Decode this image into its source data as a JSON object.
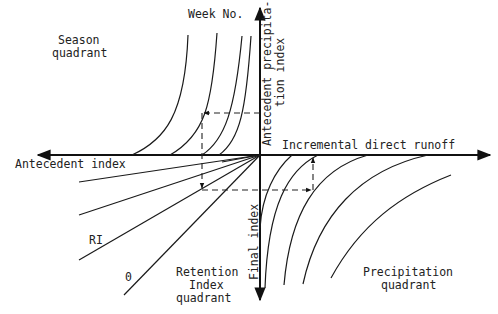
{
  "labels": {
    "week_no": "Week No.",
    "season_quadrant_line1": "Season",
    "season_quadrant_line2": "quadrant",
    "antecedent_precip_line1": "Antecedent precipita-",
    "antecedent_precip_line2": "tion index",
    "incremental_runoff": "Incremental direct runoff",
    "antecedent_index": "Antecedent index",
    "ri": "RI",
    "zero": "0",
    "retention_line1": "Retention",
    "retention_line2": "Index",
    "retention_line3": "quadrant",
    "final_index": "Final index",
    "precip_quadrant_line1": "Precipitation",
    "precip_quadrant_line2": "quadrant"
  },
  "colors": {
    "line": "#1a1a1a",
    "background": "#ffffff"
  },
  "quadrants": [
    {
      "name": "Season quadrant",
      "position": "upper-left",
      "curve_count": 4
    },
    {
      "name": "Retention Index quadrant",
      "position": "lower-left",
      "ray_count": 5
    },
    {
      "name": "Precipitation quadrant",
      "position": "lower-right",
      "curve_count": 5
    }
  ]
}
